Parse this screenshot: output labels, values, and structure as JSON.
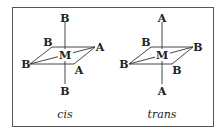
{
  "figure": {
    "panels": [
      {
        "id": "cis",
        "caption": "cis",
        "center": "M",
        "axial_top": "B",
        "axial_bottom": "B",
        "equatorial_back_left": "B",
        "equatorial_right": "A",
        "equatorial_left": "B",
        "equatorial_front": "A"
      },
      {
        "id": "trans",
        "caption": "trans",
        "center": "M",
        "axial_top": "A",
        "axial_bottom": "A",
        "equatorial_back_left": "B",
        "equatorial_right": "B",
        "equatorial_left": "B",
        "equatorial_front": "B"
      }
    ],
    "colors": {
      "stroke": "#333333",
      "text": "#222222",
      "frame": "#555555"
    }
  }
}
